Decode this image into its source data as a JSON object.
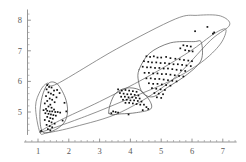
{
  "chart_data": {
    "type": "scatter",
    "title": "",
    "subtitle": "",
    "xlabel": "",
    "ylabel": "",
    "xlim": [
      0.55,
      7.45
    ],
    "ylim": [
      4.25,
      8.35
    ],
    "grid": false,
    "legend": null,
    "xticks": [
      1,
      2,
      3,
      4,
      5,
      6,
      7
    ],
    "xtick_labels": [
      "1",
      "2",
      "3",
      "4",
      "5",
      "6",
      "7"
    ],
    "yticks": [
      5,
      6,
      7,
      8
    ],
    "ytick_labels": [
      "5",
      "6",
      "7",
      "8"
    ],
    "minor_tick_step": 0.2,
    "marker": "square",
    "marker_color": "#111111",
    "hull_color": "#6e6e6e",
    "series": [
      {
        "name": "cluster-left",
        "points": [
          [
            1.3,
            5.88
          ],
          [
            1.36,
            5.82
          ],
          [
            1.44,
            5.8
          ],
          [
            1.28,
            5.74
          ],
          [
            1.52,
            5.7
          ],
          [
            1.34,
            5.64
          ],
          [
            1.42,
            5.6
          ],
          [
            1.5,
            5.56
          ],
          [
            1.26,
            5.52
          ],
          [
            1.6,
            5.48
          ],
          [
            1.38,
            5.44
          ],
          [
            1.46,
            5.4
          ],
          [
            1.3,
            5.36
          ],
          [
            1.54,
            5.32
          ],
          [
            1.22,
            5.28
          ],
          [
            1.4,
            5.24
          ],
          [
            1.34,
            5.18
          ],
          [
            1.44,
            5.14
          ],
          [
            1.26,
            5.1
          ],
          [
            1.52,
            5.08
          ],
          [
            1.18,
            5.06
          ],
          [
            1.3,
            5.04
          ],
          [
            1.38,
            5.02
          ],
          [
            1.46,
            5.02
          ],
          [
            1.56,
            5.0
          ],
          [
            1.64,
            5.0
          ],
          [
            1.72,
            4.98
          ],
          [
            1.24,
            4.96
          ],
          [
            1.34,
            4.94
          ],
          [
            1.42,
            4.92
          ],
          [
            1.5,
            4.9
          ],
          [
            1.58,
            4.88
          ],
          [
            1.3,
            4.84
          ],
          [
            1.4,
            4.8
          ],
          [
            1.48,
            4.78
          ],
          [
            1.22,
            4.74
          ],
          [
            1.36,
            4.7
          ],
          [
            1.44,
            4.66
          ],
          [
            1.54,
            4.62
          ],
          [
            1.28,
            4.58
          ],
          [
            1.38,
            4.54
          ],
          [
            1.46,
            4.5
          ],
          [
            1.32,
            4.44
          ],
          [
            1.4,
            4.4
          ],
          [
            1.1,
            4.38
          ],
          [
            1.86,
            5.3
          ],
          [
            1.92,
            5.02
          ],
          [
            1.8,
            4.72
          ],
          [
            1.7,
            5.62
          ],
          [
            1.62,
            5.72
          ]
        ]
      },
      {
        "name": "cluster-middle",
        "points": [
          [
            3.6,
            5.74
          ],
          [
            3.72,
            5.7
          ],
          [
            3.84,
            5.72
          ],
          [
            3.96,
            5.7
          ],
          [
            4.08,
            5.68
          ],
          [
            4.2,
            5.66
          ],
          [
            3.66,
            5.62
          ],
          [
            3.78,
            5.6
          ],
          [
            3.9,
            5.58
          ],
          [
            4.02,
            5.58
          ],
          [
            4.14,
            5.56
          ],
          [
            4.26,
            5.54
          ],
          [
            3.7,
            5.5
          ],
          [
            3.82,
            5.5
          ],
          [
            3.94,
            5.48
          ],
          [
            4.06,
            5.48
          ],
          [
            4.18,
            5.46
          ],
          [
            4.3,
            5.44
          ],
          [
            3.76,
            5.4
          ],
          [
            3.88,
            5.4
          ],
          [
            4.0,
            5.38
          ],
          [
            4.12,
            5.38
          ],
          [
            4.24,
            5.36
          ],
          [
            4.36,
            5.34
          ],
          [
            3.84,
            5.3
          ],
          [
            3.96,
            5.3
          ],
          [
            4.08,
            5.28
          ],
          [
            4.2,
            5.26
          ],
          [
            4.32,
            5.24
          ],
          [
            4.44,
            5.24
          ],
          [
            3.44,
            5.02
          ],
          [
            3.52,
            5.0
          ],
          [
            3.38,
            4.96
          ],
          [
            3.6,
            4.98
          ],
          [
            3.94,
            4.92
          ],
          [
            4.52,
            5.16
          ],
          [
            4.58,
            5.1
          ],
          [
            4.4,
            5.06
          ]
        ]
      },
      {
        "name": "cluster-right",
        "points": [
          [
            5.72,
            7.18
          ],
          [
            5.84,
            7.16
          ],
          [
            5.96,
            7.14
          ],
          [
            5.62,
            7.08
          ],
          [
            5.78,
            7.02
          ],
          [
            5.9,
            7.0
          ],
          [
            6.02,
            6.98
          ],
          [
            4.52,
            6.82
          ],
          [
            4.64,
            6.8
          ],
          [
            4.76,
            6.82
          ],
          [
            4.88,
            6.78
          ],
          [
            5.0,
            6.78
          ],
          [
            5.16,
            6.8
          ],
          [
            5.3,
            6.76
          ],
          [
            5.46,
            6.74
          ],
          [
            5.6,
            6.72
          ],
          [
            5.74,
            6.7
          ],
          [
            5.88,
            6.68
          ],
          [
            6.0,
            6.66
          ],
          [
            4.44,
            6.66
          ],
          [
            4.58,
            6.64
          ],
          [
            4.7,
            6.62
          ],
          [
            4.84,
            6.62
          ],
          [
            4.98,
            6.6
          ],
          [
            5.12,
            6.6
          ],
          [
            5.26,
            6.58
          ],
          [
            5.4,
            6.56
          ],
          [
            5.54,
            6.56
          ],
          [
            5.68,
            6.54
          ],
          [
            5.82,
            6.52
          ],
          [
            5.96,
            6.5
          ],
          [
            4.4,
            6.48
          ],
          [
            4.54,
            6.46
          ],
          [
            4.66,
            6.46
          ],
          [
            4.8,
            6.44
          ],
          [
            4.94,
            6.44
          ],
          [
            5.08,
            6.42
          ],
          [
            5.22,
            6.42
          ],
          [
            5.36,
            6.4
          ],
          [
            5.5,
            6.38
          ],
          [
            5.64,
            6.36
          ],
          [
            5.78,
            6.34
          ],
          [
            4.46,
            6.28
          ],
          [
            4.6,
            6.28
          ],
          [
            4.74,
            6.26
          ],
          [
            4.88,
            6.26
          ],
          [
            5.02,
            6.24
          ],
          [
            5.16,
            6.24
          ],
          [
            5.3,
            6.22
          ],
          [
            5.44,
            6.2
          ],
          [
            5.58,
            6.18
          ],
          [
            5.72,
            6.16
          ],
          [
            4.52,
            6.1
          ],
          [
            4.66,
            6.1
          ],
          [
            4.8,
            6.08
          ],
          [
            4.94,
            6.08
          ],
          [
            5.08,
            6.06
          ],
          [
            5.22,
            6.04
          ],
          [
            5.36,
            6.02
          ],
          [
            5.5,
            6.0
          ],
          [
            4.6,
            5.94
          ],
          [
            4.74,
            5.92
          ],
          [
            4.88,
            5.92
          ],
          [
            5.02,
            5.9
          ],
          [
            5.16,
            5.88
          ],
          [
            5.3,
            5.86
          ],
          [
            4.7,
            5.78
          ],
          [
            4.84,
            5.76
          ],
          [
            4.98,
            5.74
          ],
          [
            5.12,
            5.72
          ],
          [
            4.78,
            5.62
          ],
          [
            4.92,
            5.6
          ],
          [
            5.06,
            5.58
          ],
          [
            4.86,
            5.48
          ],
          [
            5.0,
            5.46
          ],
          [
            6.1,
            7.64
          ],
          [
            6.5,
            7.78
          ],
          [
            6.72,
            7.6
          ],
          [
            6.68,
            7.56
          ]
        ]
      }
    ],
    "hulls": [
      {
        "name": "outer-hull",
        "closed": true,
        "vertices": [
          [
            1.06,
            4.34
          ],
          [
            0.92,
            5.18
          ],
          [
            1.08,
            5.7
          ],
          [
            1.3,
            5.94
          ],
          [
            1.62,
            5.92
          ],
          [
            3.55,
            7.06
          ],
          [
            5.46,
            8.04
          ],
          [
            6.18,
            8.16
          ],
          [
            6.92,
            8.14
          ],
          [
            7.22,
            7.84
          ],
          [
            6.6,
            7.34
          ],
          [
            5.3,
            6.0
          ],
          [
            3.7,
            5.0
          ],
          [
            2.2,
            4.52
          ],
          [
            1.3,
            4.32
          ]
        ]
      },
      {
        "name": "middle-hull",
        "closed": true,
        "vertices": [
          [
            1.08,
            4.34
          ],
          [
            2.6,
            4.88
          ],
          [
            3.96,
            5.44
          ],
          [
            5.3,
            6.02
          ],
          [
            6.3,
            6.62
          ],
          [
            6.92,
            7.22
          ],
          [
            7.1,
            7.7
          ],
          [
            6.72,
            7.56
          ],
          [
            5.9,
            6.96
          ],
          [
            4.5,
            6.12
          ],
          [
            3.0,
            5.34
          ],
          [
            1.7,
            4.72
          ]
        ]
      },
      {
        "name": "left-cluster-hull",
        "closed": true,
        "vertices": [
          [
            1.14,
            4.36
          ],
          [
            1.06,
            4.92
          ],
          [
            1.14,
            5.52
          ],
          [
            1.34,
            5.94
          ],
          [
            1.62,
            5.92
          ],
          [
            1.88,
            5.48
          ],
          [
            1.96,
            5.02
          ],
          [
            1.84,
            4.64
          ],
          [
            1.48,
            4.38
          ]
        ]
      },
      {
        "name": "middle-cluster-hull",
        "closed": true,
        "vertices": [
          [
            3.3,
            4.96
          ],
          [
            3.48,
            5.56
          ],
          [
            3.86,
            5.78
          ],
          [
            4.3,
            5.72
          ],
          [
            4.62,
            5.38
          ],
          [
            4.66,
            5.1
          ],
          [
            4.2,
            4.98
          ],
          [
            3.7,
            4.94
          ]
        ]
      },
      {
        "name": "right-cluster-hull",
        "closed": true,
        "vertices": [
          [
            4.28,
            6.38
          ],
          [
            4.62,
            6.92
          ],
          [
            5.3,
            7.26
          ],
          [
            6.06,
            7.3
          ],
          [
            6.3,
            7.28
          ],
          [
            6.3,
            6.7
          ],
          [
            5.86,
            6.24
          ],
          [
            5.2,
            5.8
          ],
          [
            4.74,
            5.5
          ],
          [
            4.4,
            5.62
          ],
          [
            4.26,
            6.02
          ]
        ]
      }
    ]
  }
}
